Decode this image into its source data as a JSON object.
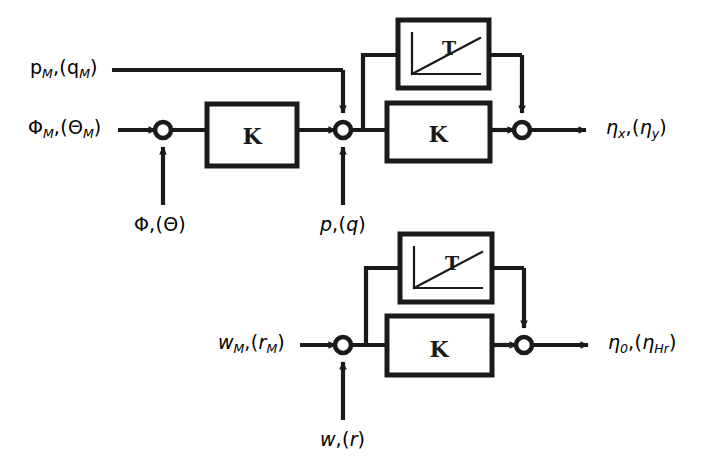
{
  "figure": {
    "background_color": "#ffffff",
    "line_color": "#1a1a1a",
    "width": 704,
    "height": 472
  },
  "blocks": [
    {
      "id": "k1",
      "label": "K",
      "kind": "gain"
    },
    {
      "id": "t1",
      "label": "T",
      "kind": "ramp"
    },
    {
      "id": "k2",
      "label": "K",
      "kind": "gain"
    },
    {
      "id": "t2",
      "label": "T",
      "kind": "ramp"
    },
    {
      "id": "k3",
      "label": "K",
      "kind": "gain"
    }
  ],
  "labels": {
    "in_top": {
      "main": "p",
      "main_sub": "M",
      "paren": "q",
      "paren_sub": "M"
    },
    "in_mid": {
      "main": "Φ",
      "main_sub": "M",
      "paren": "Θ",
      "paren_sub": "M"
    },
    "in_bottom": {
      "main": "w",
      "main_sub": "M",
      "paren": "r",
      "paren_sub": "M"
    },
    "feed_left": {
      "main": "Φ",
      "main_sub": "",
      "paren": "Θ",
      "paren_sub": ""
    },
    "feed_mid": {
      "main": "p",
      "main_sub": "",
      "paren": "q",
      "paren_sub": ""
    },
    "feed_bottom": {
      "main": "w",
      "main_sub": "",
      "paren": "r",
      "paren_sub": ""
    },
    "out_top": {
      "main": "η",
      "main_sub": "x",
      "paren": "η",
      "paren_sub": "y"
    },
    "out_bottom": {
      "main": "η",
      "main_sub": "0",
      "paren": "η",
      "paren_sub": "Hr"
    }
  },
  "text": {
    "in_top": "pₘ,(qₘ)",
    "in_mid": "Φₘ,(Θₘ)",
    "in_bottom": "wₘ,(rₘ)",
    "feed_left": "Φ,(Θ)",
    "feed_mid": "p,(q)",
    "feed_bottom": "w,(r)",
    "out_top": "ηₓ,(ηᵧ)",
    "out_bottom": "η₀,(ηₕᵣ)",
    "block_k": "K",
    "block_t": "T",
    "caption": ""
  },
  "junctions": [
    {
      "id": "sum1",
      "x": 163,
      "y": 130
    },
    {
      "id": "sum2",
      "x": 343,
      "y": 130
    },
    {
      "id": "sum3",
      "x": 522,
      "y": 130
    },
    {
      "id": "sum4",
      "x": 343,
      "y": 345
    },
    {
      "id": "sum5",
      "x": 524,
      "y": 345
    }
  ]
}
